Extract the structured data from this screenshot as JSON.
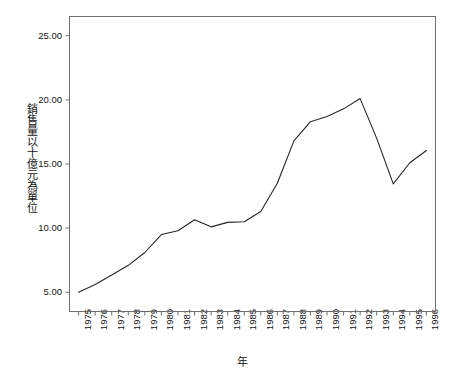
{
  "chart_data": {
    "type": "line",
    "title": "",
    "xlabel": "年",
    "ylabel": "銷售量以十億元為單位",
    "categories": [
      "1975",
      "1976",
      "1977",
      "1978",
      "1979",
      "1980",
      "1981",
      "1982",
      "1983",
      "1984",
      "1985",
      "1986",
      "1987",
      "1988",
      "1989",
      "1990",
      "1991",
      "1992",
      "1993",
      "1994",
      "1995",
      "1996"
    ],
    "values": [
      5.0,
      5.6,
      6.35,
      7.1,
      8.1,
      9.5,
      9.8,
      10.65,
      10.1,
      10.45,
      10.5,
      11.3,
      13.5,
      16.8,
      18.3,
      18.7,
      19.3,
      20.1,
      17.0,
      13.45,
      15.1,
      16.05
    ],
    "series": [
      {
        "name": "銷售量",
        "values": [
          5.0,
          5.6,
          6.35,
          7.1,
          8.1,
          9.5,
          9.8,
          10.65,
          10.1,
          10.45,
          10.5,
          11.3,
          13.5,
          16.8,
          18.3,
          18.7,
          19.3,
          20.1,
          17.0,
          13.45,
          15.1,
          16.05
        ]
      }
    ],
    "ytick_labels": [
      "25.00",
      "20.00",
      "15.00",
      "10.00",
      "5.00"
    ],
    "ytick_values": [
      25,
      20,
      15,
      10,
      5
    ],
    "ylim": [
      3.5,
      26.5
    ],
    "xlim_index": [
      -0.55,
      21.55
    ],
    "grid": false,
    "legend": "none",
    "line_color": "#262626",
    "axis_color": "#6e6e6e",
    "background": "#ffffff"
  }
}
